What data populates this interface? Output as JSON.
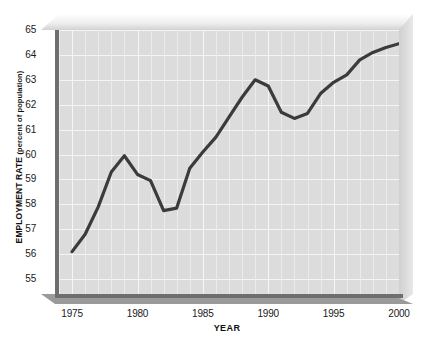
{
  "chart_data": {
    "type": "line",
    "title": "",
    "xlabel": "YEAR",
    "ylabel": "EMPLOYMENT RATE (percent of population)",
    "ylabel_main": "EMPLOYMENT RATE",
    "ylabel_sub": "(percent of population)",
    "xlim": [
      1974,
      2000
    ],
    "ylim": [
      54.4,
      65
    ],
    "grid": true,
    "legend": "none",
    "xticks": [
      1975,
      1980,
      1985,
      1990,
      1995,
      2000
    ],
    "xtick_labels": [
      "1975",
      "1980",
      "1985",
      "1990",
      "1995",
      "2000"
    ],
    "yticks": [
      55,
      56,
      57,
      58,
      59,
      60,
      61,
      62,
      63,
      64,
      65
    ],
    "ytick_labels": [
      "55",
      "56",
      "57",
      "58",
      "59",
      "60",
      "61",
      "62",
      "63",
      "64",
      "65"
    ],
    "x": [
      1975,
      1976,
      1977,
      1978,
      1979,
      1980,
      1981,
      1982,
      1983,
      1984,
      1985,
      1986,
      1987,
      1988,
      1989,
      1990,
      1991,
      1992,
      1993,
      1994,
      1995,
      1996,
      1997,
      1998,
      1999,
      2000
    ],
    "values": [
      56.1,
      56.8,
      57.9,
      59.3,
      59.95,
      59.2,
      58.95,
      57.75,
      57.85,
      59.45,
      60.1,
      60.7,
      61.5,
      62.3,
      63.0,
      62.75,
      61.7,
      61.45,
      61.65,
      62.45,
      62.9,
      63.2,
      63.8,
      64.1,
      64.3,
      64.45
    ],
    "series": [
      {
        "name": "Employment rate",
        "color": "#3b3b3b",
        "values": [
          56.1,
          56.8,
          57.9,
          59.3,
          59.95,
          59.2,
          58.95,
          57.75,
          57.85,
          59.45,
          60.1,
          60.7,
          61.5,
          62.3,
          63.0,
          62.75,
          61.7,
          61.45,
          61.65,
          62.45,
          62.9,
          63.2,
          63.8,
          64.1,
          64.3,
          64.45
        ]
      }
    ],
    "style": {
      "plot_background": "#dcdcdc",
      "gridline_color": "#f4f4f4",
      "line_color": "#3b3b3b",
      "line_width": 3.2,
      "axis_color": "#6e6e6e",
      "bevel_top_color": "#ededed",
      "bevel_right_color": "#cfcfcf",
      "bevel_bottom_color": "#9a9a9a",
      "text_color": "#1a1a1a",
      "page_background": "#ffffff"
    }
  }
}
